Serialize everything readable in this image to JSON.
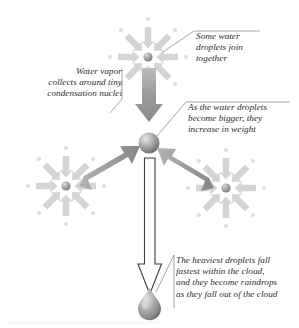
{
  "figure": {
    "background_color": "#ffffff",
    "text_color": "#2b2b2b",
    "arrow_color": "#9b9b9b",
    "starburst_color": "#d2d2d2",
    "outline_arrow_fill": "#ffffff",
    "outline_arrow_stroke": "#3a3a3a"
  },
  "captions": {
    "water_vapor": "Water vapor\ncollects around tiny\ncondensation nuclei",
    "droplets_join": "Some water\ndroplets join\ntogether",
    "increase_weight": "As the water droplets\nbecome bigger, they\nincrease in weight",
    "heaviest_fall": "The heaviest droplets fall\nfastest within the cloud,\nand they become raindrops\nas they fall out of the cloud"
  },
  "elements": {
    "top_nucleus_label": "condensation nucleus with converging water vapor",
    "left_nucleus_label": "condensation nucleus with converging water vapor",
    "right_nucleus_label": "condensation nucleus with converging water vapor",
    "center_droplet_label": "enlarged water droplet",
    "raindrop_label": "falling raindrop",
    "down_arrow_label": "droplet merging downward",
    "left_merge_arrow_label": "droplet merging from lower left",
    "right_merge_arrow_label": "droplet merging from lower right",
    "fall_arrow_label": "raindrop falling out of cloud"
  }
}
